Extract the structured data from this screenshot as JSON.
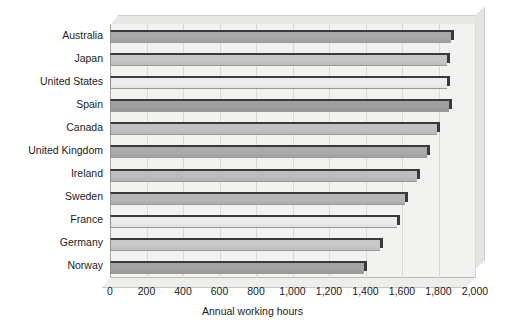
{
  "chart_data": {
    "type": "bar",
    "orientation": "horizontal",
    "title": "",
    "xlabel": "Annual working hours",
    "ylabel": "",
    "categories": [
      "Australia",
      "Japan",
      "United States",
      "Spain",
      "Canada",
      "United Kingdom",
      "Ireland",
      "Sweden",
      "France",
      "Germany",
      "Norway"
    ],
    "values": [
      1870,
      1845,
      1845,
      1855,
      1790,
      1735,
      1680,
      1615,
      1570,
      1480,
      1390
    ],
    "bar_colors": [
      "#a9a9a9",
      "#c6c6c6",
      "#ededed",
      "#a0a0a0",
      "#c1c1c1",
      "#ababab",
      "#bdbdbd",
      "#b6b6b6",
      "#eaeaea",
      "#c9c9c9",
      "#a4a4a4"
    ],
    "xlim": [
      0,
      2000
    ],
    "xticks": [
      0,
      200,
      400,
      600,
      800,
      1000,
      1200,
      1400,
      1600,
      1800,
      2000
    ],
    "xtick_labels": [
      "0",
      "200",
      "400",
      "600",
      "800",
      "1,000",
      "1,200",
      "1,400",
      "1,600",
      "1,800",
      "2,000"
    ],
    "grid": true,
    "grid_axis": "x",
    "legend": false,
    "plot_background": "#f2f2f0",
    "gridline_color": "#d8d8d4",
    "axis_color": "#a9a9a5",
    "text_color": "#1c1c1c"
  }
}
